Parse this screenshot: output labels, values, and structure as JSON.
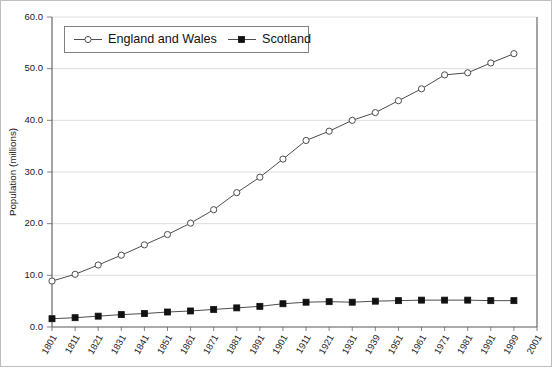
{
  "chart_data": {
    "type": "line",
    "title": "",
    "xlabel": "",
    "ylabel": "Population (millions)",
    "ylim": [
      0.0,
      60.0
    ],
    "ytick_step": 10.0,
    "grid": true,
    "legend_position": "top-left-inside",
    "categories": [
      "1801",
      "1811",
      "1821",
      "1831",
      "1841",
      "1851",
      "1861",
      "1871",
      "1881",
      "1891",
      "1901",
      "1911",
      "1921",
      "1931",
      "1939",
      "1951",
      "1961",
      "1971",
      "1981",
      "1991",
      "1999",
      "2001"
    ],
    "ytick_labels": [
      "0.0",
      "10.0",
      "20.0",
      "30.0",
      "40.0",
      "50.0",
      "60.0"
    ],
    "series": [
      {
        "name": "England and Wales",
        "marker": "open-circle",
        "values": [
          8.9,
          10.2,
          12.0,
          13.9,
          15.9,
          17.9,
          20.1,
          22.7,
          26.0,
          29.0,
          32.5,
          36.1,
          37.9,
          40.0,
          41.5,
          43.8,
          46.1,
          48.8,
          49.2,
          51.1,
          52.9,
          null
        ]
      },
      {
        "name": "Scotland",
        "marker": "filled-square",
        "values": [
          1.6,
          1.8,
          2.1,
          2.4,
          2.6,
          2.9,
          3.1,
          3.4,
          3.7,
          4.0,
          4.5,
          4.8,
          4.9,
          4.8,
          5.0,
          5.1,
          5.2,
          5.2,
          5.2,
          5.1,
          5.1,
          null
        ]
      }
    ]
  },
  "legend": {
    "entries": [
      {
        "label": "England and Wales",
        "marker": "open-circle"
      },
      {
        "label": "Scotland",
        "marker": "filled-square"
      }
    ]
  },
  "axes": {
    "y_title": "Population (millions)"
  }
}
